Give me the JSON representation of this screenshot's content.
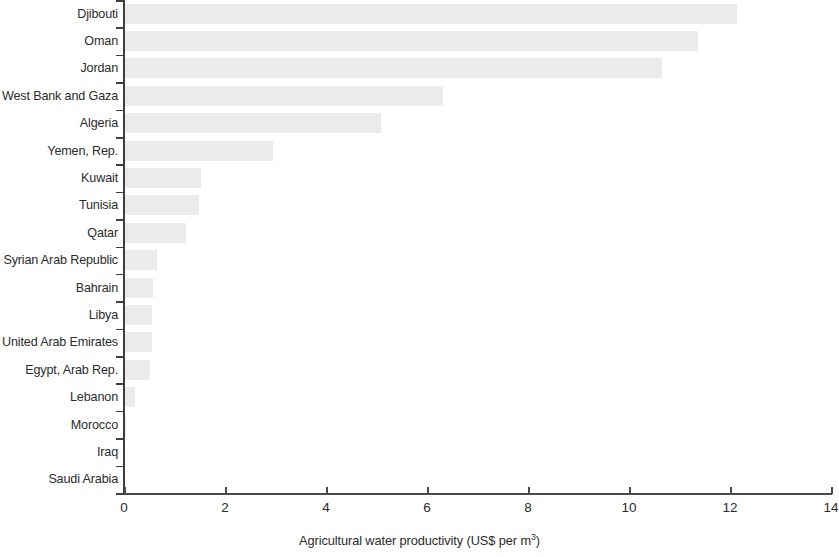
{
  "chart_data": {
    "type": "bar",
    "orientation": "horizontal",
    "title": "",
    "subtitle": "",
    "xlabel": "Agricultural water productivity (US$ per m³)",
    "xlabel_base": "Agricultural water productivity (US$ per m",
    "xlabel_sup": "3",
    "xlabel_tail": ")",
    "ylabel": "",
    "xlim": [
      0,
      14
    ],
    "xticks": [
      0,
      2,
      4,
      6,
      8,
      10,
      12,
      14
    ],
    "xtick_labels": [
      "0",
      "2",
      "4",
      "6",
      "8",
      "10",
      "12",
      "14"
    ],
    "grid": false,
    "legend": false,
    "bar_color": "#ebebeb",
    "axis_color": "#3f3f3f",
    "text_color": "#2b2b2b",
    "categories": [
      "Djibouti",
      "Oman",
      "Jordan",
      "West Bank and Gaza",
      "Algeria",
      "Yemen, Rep.",
      "Kuwait",
      "Tunisia",
      "Qatar",
      "Syrian Arab Republic",
      "Bahrain",
      "Libya",
      "United Arab Emirates",
      "Egypt, Arab Rep.",
      "Lebanon",
      "Morocco",
      "Iraq",
      "Saudi Arabia"
    ],
    "values": [
      12.13,
      11.36,
      10.65,
      6.32,
      5.08,
      2.96,
      1.53,
      1.48,
      1.23,
      0.65,
      0.57,
      0.55,
      0.55,
      0.52,
      0.22,
      0.03,
      0.0,
      0.0
    ],
    "series": [
      {
        "name": "Agricultural water productivity",
        "values": [
          12.13,
          11.36,
          10.65,
          6.32,
          5.08,
          2.96,
          1.53,
          1.48,
          1.23,
          0.65,
          0.57,
          0.55,
          0.55,
          0.52,
          0.22,
          0.03,
          0.0,
          0.0
        ]
      }
    ]
  }
}
